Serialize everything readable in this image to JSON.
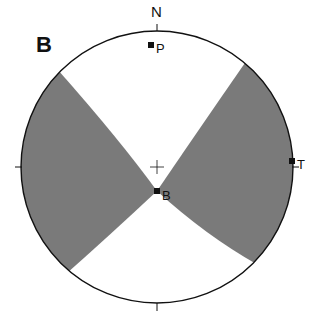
{
  "panel_label": "B",
  "north_label": "N",
  "colors": {
    "shade": "#7a7a7a",
    "line": "#111111",
    "background": "#ffffff"
  },
  "points": [
    {
      "id": "P",
      "label": "P",
      "x": 151,
      "y": 45
    },
    {
      "id": "T",
      "label": "T",
      "x": 292,
      "y": 161
    },
    {
      "id": "B",
      "label": "B",
      "x": 157,
      "y": 191
    }
  ]
}
